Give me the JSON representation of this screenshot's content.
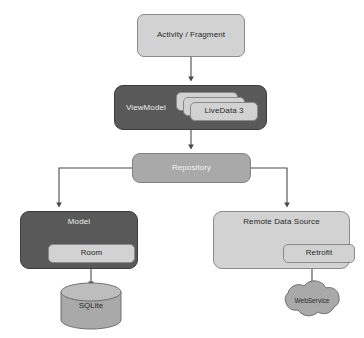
{
  "diagram": {
    "background": "#ffffff",
    "colors": {
      "light_fill": "#d2d2d2",
      "dark_fill": "#595959",
      "mid_fill": "#a9a9a9",
      "stroke": "#8a8a8a",
      "dark_text": "#2a2a2a",
      "light_text": "#ededed",
      "connector": "#555555"
    },
    "nodes": {
      "activity_fragment": {
        "label": "Activity / Fragment",
        "style": "light",
        "shape": "rounded-rect"
      },
      "viewmodel": {
        "label": "ViewModel",
        "style": "dark",
        "shape": "rounded-rect"
      },
      "livedata_cards": [
        {
          "label": "",
          "style": "light"
        },
        {
          "label": "",
          "style": "light"
        },
        {
          "label": "LiveData 3",
          "style": "light"
        }
      ],
      "repository": {
        "label": "Repository",
        "style": "mid",
        "shape": "rounded-rect"
      },
      "model": {
        "label": "Model",
        "style": "dark",
        "shape": "rounded-rect"
      },
      "room": {
        "label": "Room",
        "style": "light",
        "shape": "rounded-rect"
      },
      "remote_data_source": {
        "label": "Remote Data Source",
        "style": "light",
        "shape": "rounded-rect"
      },
      "retrofit": {
        "label": "Retrofit",
        "style": "light",
        "shape": "rounded-rect"
      },
      "sqlite": {
        "label": "SQLite",
        "style": "mid",
        "shape": "cylinder"
      },
      "webservice": {
        "label": "WebService",
        "style": "mid",
        "shape": "cloud"
      }
    },
    "edges": [
      {
        "from": "activity_fragment",
        "to": "viewmodel",
        "type": "straight-arrow"
      },
      {
        "from": "viewmodel",
        "to": "repository",
        "type": "straight-arrow"
      },
      {
        "from": "repository",
        "to": "model",
        "type": "elbow-arrow"
      },
      {
        "from": "repository",
        "to": "remote_data_source",
        "type": "elbow-arrow"
      },
      {
        "from": "room",
        "to": "sqlite",
        "type": "straight-arrow"
      },
      {
        "from": "retrofit",
        "to": "webservice",
        "type": "straight-arrow"
      }
    ]
  }
}
